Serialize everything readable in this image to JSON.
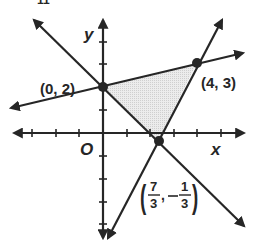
{
  "figure": {
    "type": "feasible-region-graph",
    "top_fragment": "11",
    "axes": {
      "x_label": "x",
      "y_label": "y",
      "origin_label": "O",
      "x_ticks": [
        -4,
        -3,
        -2,
        -1,
        1,
        2,
        3,
        4,
        5
      ],
      "y_ticks": [
        -4,
        -3,
        -2,
        -1,
        1,
        2,
        3,
        4
      ]
    },
    "vertices": [
      {
        "label": "(0, 2)",
        "x": 0,
        "y": 2
      },
      {
        "label": "(4, 3)",
        "x": 4,
        "y": 3
      },
      {
        "label_num": "7",
        "label_num2": "1",
        "label_den": "3",
        "label_den2": "3",
        "x": 2.3333,
        "y": -0.3333
      }
    ],
    "lines": [
      {
        "name": "line through (0,2) and (4,3)",
        "slope": 0.25,
        "intercept": 2
      },
      {
        "name": "line through (0,2) and (7/3,-1/3)",
        "slope": -1,
        "intercept": 2
      },
      {
        "name": "line through (4,3) and (7/3,-1/3)",
        "slope": 2,
        "intercept": -5
      }
    ],
    "shaded_region": "triangle with vertices (0,2), (4,3), (7/3,-1/3)",
    "colors": {
      "ink": "#262626",
      "shade": "#e6e6e6"
    }
  }
}
